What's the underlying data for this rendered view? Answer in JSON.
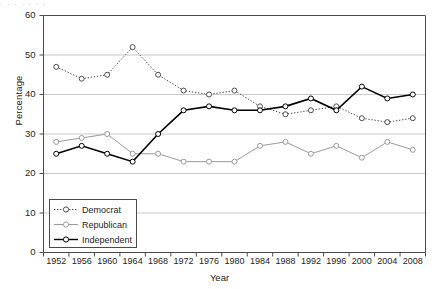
{
  "figure": {
    "cropped_caption_fragment": "· ·   ·     ·          ·        ·         ·",
    "xtitle": "Year",
    "ytitle": "Percentage"
  },
  "legend": {
    "position": "inside-lower-left",
    "entries": [
      {
        "label": "Democrat",
        "style": "dotted",
        "marker": "open-circle",
        "color": "#4d4d4d"
      },
      {
        "label": "Republican",
        "style": "solid",
        "marker": "open-circle",
        "color": "#9a9a9a"
      },
      {
        "label": "Independent",
        "style": "solid",
        "marker": "open-circle",
        "color": "#000000"
      }
    ]
  },
  "chart_data": {
    "type": "line",
    "title": "",
    "xlabel": "Year",
    "ylabel": "Percentage",
    "xlim": [
      1950,
      2010
    ],
    "ylim": [
      0,
      60
    ],
    "yticks": [
      0,
      10,
      20,
      30,
      40,
      50,
      60
    ],
    "grid": "horizontal",
    "categories": [
      1952,
      1956,
      1960,
      1964,
      1968,
      1972,
      1976,
      1980,
      1984,
      1988,
      1992,
      1996,
      2000,
      2004,
      2008
    ],
    "xticklabels": [
      "1952",
      "1956",
      "1960",
      "1964",
      "1968",
      "1972",
      "1976",
      "1980",
      "1984",
      "1988",
      "1992",
      "1996",
      "2000",
      "2004",
      "2008"
    ],
    "series": [
      {
        "name": "Democrat",
        "color": "#4d4d4d",
        "linestyle": "dotted",
        "marker": "open-circle",
        "values": [
          47,
          44,
          45,
          52,
          45,
          41,
          40,
          41,
          37,
          35,
          36,
          37,
          34,
          33,
          34
        ]
      },
      {
        "name": "Republican",
        "color": "#9a9a9a",
        "linestyle": "solid",
        "marker": "open-circle",
        "values": [
          28,
          29,
          30,
          25,
          25,
          23,
          23,
          23,
          27,
          28,
          25,
          27,
          24,
          28,
          26
        ]
      },
      {
        "name": "Independent",
        "color": "#000000",
        "linestyle": "solid",
        "marker": "open-circle",
        "values": [
          25,
          27,
          25,
          23,
          30,
          36,
          37,
          36,
          36,
          37,
          39,
          36,
          42,
          39,
          40
        ]
      }
    ]
  }
}
